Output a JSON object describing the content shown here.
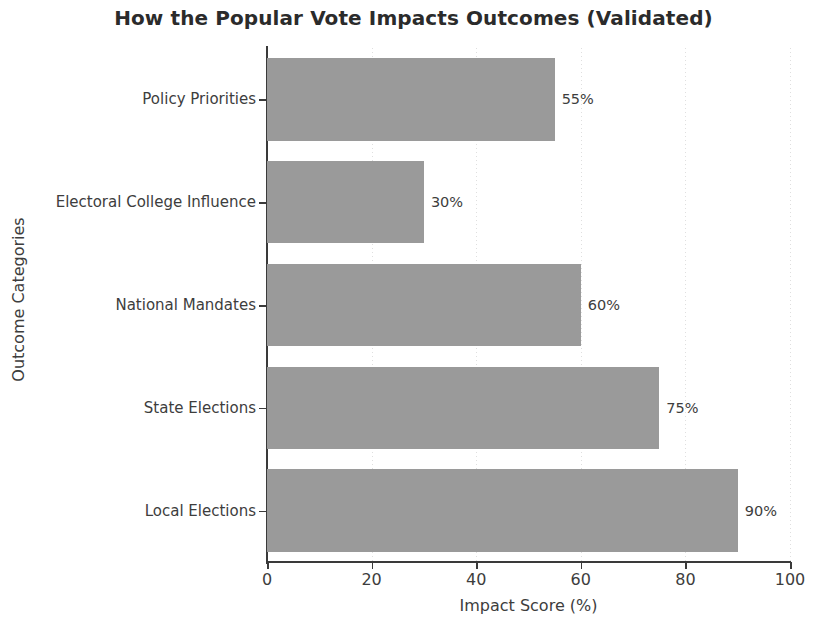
{
  "chart_data": {
    "type": "bar",
    "orientation": "horizontal",
    "title": "How the Popular Vote Impacts Outcomes (Validated)",
    "xlabel": "Impact Score (%)",
    "ylabel": "Outcome Categories",
    "categories": [
      "Policy Priorities",
      "Electoral College Influence",
      "National Mandates",
      "State Elections",
      "Local Elections"
    ],
    "values": [
      55,
      30,
      60,
      75,
      90
    ],
    "value_labels": [
      "55%",
      "30%",
      "60%",
      "75%",
      "90%"
    ],
    "xlim": [
      0,
      100
    ],
    "xticks": [
      0,
      20,
      40,
      60,
      80,
      100
    ],
    "xtick_labels": [
      "0",
      "20",
      "40",
      "60",
      "80",
      "100"
    ],
    "grid": true,
    "grid_axis": "x",
    "grid_style": "dotted",
    "legend": null,
    "bar_color": "#9a9a9a",
    "text_color": "#3d3d3d",
    "title_color": "#2b2b2b",
    "background": "#ffffff"
  }
}
